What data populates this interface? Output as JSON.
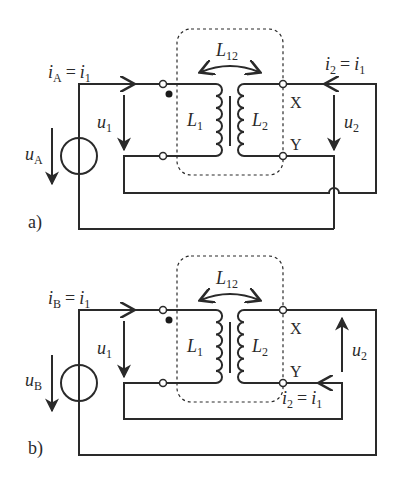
{
  "diagram": {
    "type": "coupled-inductor circuit",
    "panels": [
      {
        "id": "a",
        "label": "a)",
        "source_voltage": {
          "sym": "u",
          "sub": "A"
        },
        "source_current": {
          "lhs_sym": "i",
          "lhs_sub": "A",
          "eq": "=",
          "rhs_sym": "i",
          "rhs_sub": "1"
        },
        "primary_voltage": {
          "sym": "u",
          "sub": "1"
        },
        "secondary_voltage": {
          "sym": "u",
          "sub": "2",
          "direction": "down"
        },
        "secondary_current": {
          "lhs_sym": "i",
          "lhs_sub": "2",
          "eq": "=",
          "rhs_sym": "i",
          "rhs_sub": "1"
        },
        "mutual": {
          "sym": "L",
          "sub": "12"
        },
        "l1": {
          "sym": "L",
          "sub": "1"
        },
        "l2": {
          "sym": "L",
          "sub": "2"
        },
        "terminal_x": "X",
        "terminal_y": "Y"
      },
      {
        "id": "b",
        "label": "b)",
        "source_voltage": {
          "sym": "u",
          "sub": "B"
        },
        "source_current": {
          "lhs_sym": "i",
          "lhs_sub": "B",
          "eq": "=",
          "rhs_sym": "i",
          "rhs_sub": "1"
        },
        "primary_voltage": {
          "sym": "u",
          "sub": "1"
        },
        "secondary_voltage": {
          "sym": "u",
          "sub": "2",
          "direction": "up"
        },
        "secondary_current": {
          "lhs_sym": "i",
          "lhs_sub": "2",
          "eq": "=",
          "rhs_sym": "i",
          "rhs_sub": "1"
        },
        "mutual": {
          "sym": "L",
          "sub": "12"
        },
        "l1": {
          "sym": "L",
          "sub": "1"
        },
        "l2": {
          "sym": "L",
          "sub": "2"
        },
        "terminal_x": "X",
        "terminal_y": "Y"
      }
    ],
    "colors": {
      "line": "#2a2a2a",
      "background": "#ffffff"
    }
  }
}
